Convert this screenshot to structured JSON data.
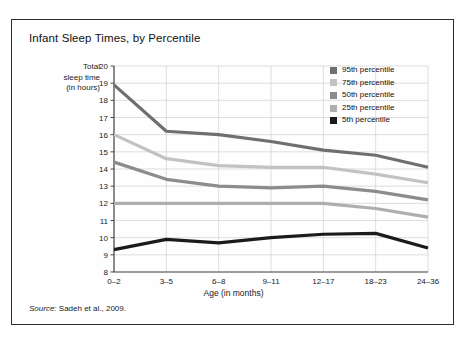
{
  "figure": {
    "title": "Infant Sleep Times, by Percentile",
    "source_keyword": "Source:",
    "source_text": " Sadeh et al., 2009."
  },
  "chart_data": {
    "type": "line",
    "title": "Infant Sleep Times, by Percentile",
    "xlabel": "Age (in months)",
    "ylabel": "Total sleep time (in hours)",
    "ylabel_lines": [
      "Total",
      "sleep time",
      "(in hours)"
    ],
    "categories": [
      "0–2",
      "3–5",
      "6–8",
      "9–11",
      "12–17",
      "18–23",
      "24–36"
    ],
    "ylim": [
      8,
      20
    ],
    "ytick_step": 1,
    "yticks": [
      8,
      9,
      10,
      11,
      12,
      13,
      14,
      15,
      16,
      17,
      18,
      19,
      20
    ],
    "grid": true,
    "legend_position": "top-right",
    "series": [
      {
        "name": "95th percentile",
        "color": "#6f6f6f",
        "values": [
          18.9,
          16.2,
          16.0,
          15.6,
          15.1,
          14.8,
          14.1
        ]
      },
      {
        "name": "75th percentile",
        "color": "#c2c2c2",
        "values": [
          16.0,
          14.6,
          14.2,
          14.1,
          14.1,
          13.7,
          13.2
        ]
      },
      {
        "name": "50th percentile",
        "color": "#8c8c8c",
        "values": [
          14.4,
          13.4,
          13.0,
          12.9,
          13.0,
          12.7,
          12.2
        ]
      },
      {
        "name": "25th percentile",
        "color": "#aeaeae",
        "values": [
          12.0,
          12.0,
          12.0,
          12.0,
          12.0,
          11.7,
          11.2
        ]
      },
      {
        "name": "5th percentile",
        "color": "#1b1b1b",
        "values": [
          9.3,
          9.9,
          9.7,
          10.0,
          10.2,
          10.25,
          9.4
        ]
      }
    ]
  },
  "legend": {
    "items": [
      {
        "label": "95th percentile",
        "color": "#6f6f6f"
      },
      {
        "label": "75th percentile",
        "color": "#c2c2c2"
      },
      {
        "label": "50th percentile",
        "color": "#8c8c8c"
      },
      {
        "label": "25th percentile",
        "color": "#aeaeae"
      },
      {
        "label": "5th percentile",
        "color": "#1b1b1b"
      }
    ]
  },
  "colors": {
    "frame": "#2b2b2b",
    "axis": "#3a3a3a",
    "grid": "#d0d0d0",
    "background": "#fefefe"
  }
}
